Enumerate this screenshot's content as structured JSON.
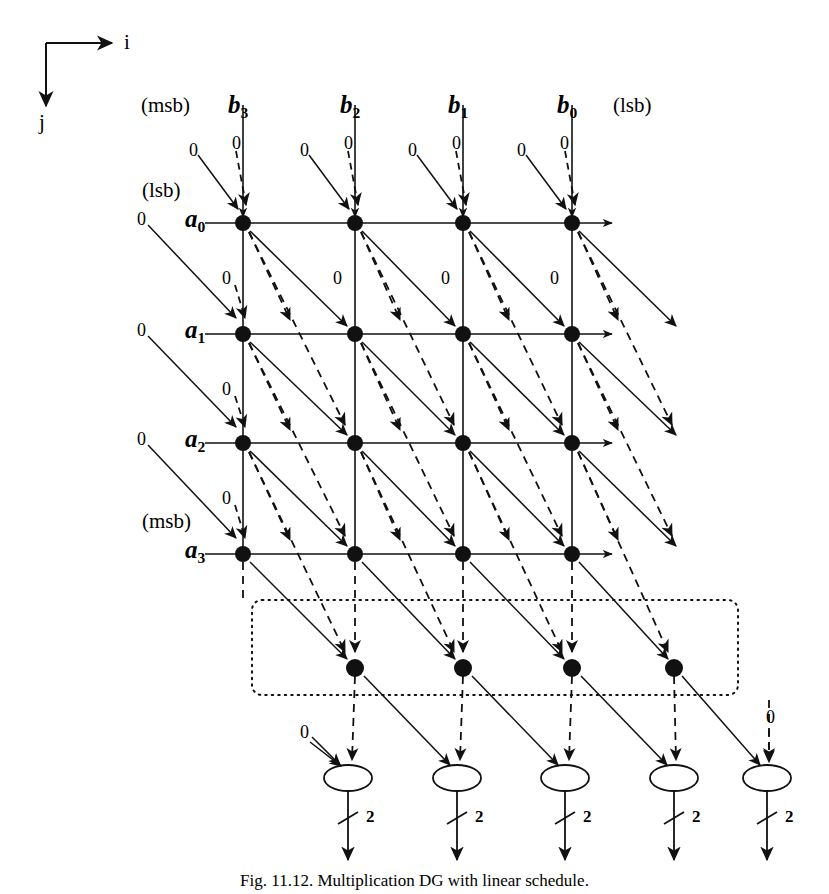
{
  "figure": {
    "caption": "Fig. 11.12.  Multiplication DG with linear schedule.",
    "caption_y": 871
  },
  "axes": {
    "i_label": "i",
    "j_label": "j",
    "origin": {
      "x": 46,
      "y": 43
    },
    "i_tip": {
      "x": 118,
      "y": 43
    },
    "j_tip": {
      "x": 46,
      "y": 112
    }
  },
  "grid": {
    "columns_x": [
      243,
      355,
      463,
      572
    ],
    "rows_y": [
      223,
      334,
      443,
      554
    ],
    "node_radius": 8
  },
  "column_labels": [
    {
      "name": "b3",
      "text": "b",
      "sub": "3",
      "x": 228,
      "y": 92,
      "significance": "(msb)",
      "sig_x": 141,
      "sig_y": 95
    },
    {
      "name": "b2",
      "text": "b",
      "sub": "2",
      "x": 340,
      "y": 92
    },
    {
      "name": "b1",
      "text": "b",
      "sub": "1",
      "x": 448,
      "y": 92
    },
    {
      "name": "b0",
      "text": "b",
      "sub": "0",
      "x": 557,
      "y": 92,
      "significance": "(lsb)",
      "sig_x": 613,
      "sig_y": 95
    }
  ],
  "row_labels": [
    {
      "name": "a0",
      "text": "a",
      "sub": "0",
      "x": 185,
      "y": 212,
      "significance": "(lsb)",
      "sig_x": 142,
      "sig_y": 180
    },
    {
      "name": "a1",
      "text": "a",
      "sub": "1",
      "x": 185,
      "y": 323,
      "significance": "",
      "sig_x": 0,
      "sig_y": 0
    },
    {
      "name": "a2",
      "text": "a",
      "sub": "2",
      "x": 185,
      "y": 432,
      "significance": "",
      "sig_x": 0,
      "sig_y": 0
    },
    {
      "name": "a3",
      "text": "a",
      "sub": "3",
      "x": 185,
      "y": 543,
      "significance": "(msb)",
      "sig_x": 142,
      "sig_y": 511
    }
  ],
  "zero_labels": [
    {
      "x": 189,
      "y": 141
    },
    {
      "x": 232,
      "y": 136
    },
    {
      "x": 300,
      "y": 141
    },
    {
      "x": 344,
      "y": 136
    },
    {
      "x": 408,
      "y": 141
    },
    {
      "x": 452,
      "y": 136
    },
    {
      "x": 517,
      "y": 141
    },
    {
      "x": 560,
      "y": 136
    },
    {
      "x": 137,
      "y": 212
    },
    {
      "x": 137,
      "y": 323
    },
    {
      "x": 137,
      "y": 432
    },
    {
      "x": 222,
      "y": 269
    },
    {
      "x": 333,
      "y": 269
    },
    {
      "x": 441,
      "y": 269
    },
    {
      "x": 550,
      "y": 269
    },
    {
      "x": 222,
      "y": 380
    },
    {
      "x": 222,
      "y": 489
    },
    {
      "x": 303,
      "y": 731
    },
    {
      "x": 771,
      "y": 716
    }
  ],
  "output_cells": {
    "bottom_nodes_y": 668,
    "bottom_nodes_x": [
      355,
      463,
      572,
      674
    ],
    "dotted_box": {
      "x": 252,
      "y": 600,
      "width": 486,
      "height": 95
    }
  },
  "adders": [
    {
      "x": 348,
      "y": 778,
      "bit_width": "2"
    },
    {
      "x": 457,
      "y": 778,
      "bit_width": "2"
    },
    {
      "x": 565,
      "y": 778,
      "bit_width": "2"
    },
    {
      "x": 674,
      "y": 778,
      "bit_width": "2"
    },
    {
      "x": 767,
      "y": 778,
      "bit_width": "2"
    }
  ]
}
